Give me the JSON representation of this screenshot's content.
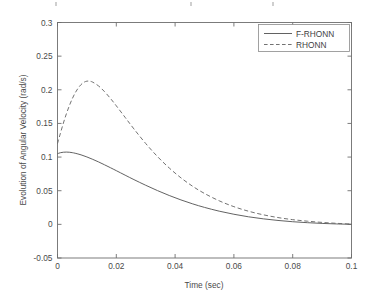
{
  "figure": {
    "background_color": "#ffffff",
    "line_color": "#5a5a5a",
    "axis_color": "#6e6e6e"
  },
  "chart_data": {
    "type": "line",
    "title": "",
    "xlabel": "Time (sec)",
    "ylabel": "Evolution of Angular Velocity (rad/s)",
    "xlim": [
      0,
      0.1
    ],
    "ylim": [
      -0.05,
      0.3
    ],
    "xticks": [
      0,
      0.02,
      0.04,
      0.06,
      0.08,
      0.1
    ],
    "xticklabels": [
      "0",
      "0.02",
      "0.04",
      "0.06",
      "0.08",
      "0.1"
    ],
    "yticks": [
      -0.05,
      0,
      0.05,
      0.1,
      0.15,
      0.2,
      0.25,
      0.3
    ],
    "yticklabels": [
      "-0.05",
      "0",
      "0.05",
      "0.1",
      "0.15",
      "0.2",
      "0.25",
      "0.3"
    ],
    "grid": false,
    "legend_position": "upper right",
    "series": [
      {
        "name": "F-RHONN",
        "style": "solid",
        "color": "#5a5a5a",
        "x": [
          0,
          0.001,
          0.002,
          0.003,
          0.004,
          0.005,
          0.006,
          0.008,
          0.01,
          0.012,
          0.014,
          0.016,
          0.018,
          0.02,
          0.023,
          0.026,
          0.03,
          0.034,
          0.038,
          0.042,
          0.046,
          0.05,
          0.055,
          0.06,
          0.065,
          0.07,
          0.075,
          0.08,
          0.085,
          0.09,
          0.095,
          0.1
        ],
        "y": [
          0.105,
          0.1065,
          0.1072,
          0.1074,
          0.1072,
          0.1066,
          0.1057,
          0.1033,
          0.1002,
          0.0966,
          0.0927,
          0.0885,
          0.0842,
          0.0798,
          0.0731,
          0.0665,
          0.0581,
          0.0502,
          0.0429,
          0.0363,
          0.0304,
          0.0252,
          0.0196,
          0.015,
          0.0112,
          0.0082,
          0.0058,
          0.0039,
          0.0025,
          0.0014,
          0.0006,
          0.0001
        ]
      },
      {
        "name": "RHONN",
        "style": "dashed",
        "color": "#6a6a6a",
        "x": [
          0,
          0.001,
          0.002,
          0.003,
          0.004,
          0.005,
          0.006,
          0.007,
          0.008,
          0.009,
          0.01,
          0.011,
          0.012,
          0.014,
          0.016,
          0.018,
          0.02,
          0.023,
          0.026,
          0.03,
          0.034,
          0.038,
          0.042,
          0.046,
          0.05,
          0.055,
          0.06,
          0.065,
          0.07,
          0.075,
          0.08,
          0.085,
          0.09,
          0.095,
          0.1
        ],
        "y": [
          0.12,
          0.1355,
          0.1505,
          0.164,
          0.176,
          0.1865,
          0.1953,
          0.2023,
          0.2077,
          0.2112,
          0.2128,
          0.2127,
          0.2113,
          0.2056,
          0.1972,
          0.1872,
          0.1762,
          0.159,
          0.1418,
          0.1202,
          0.1008,
          0.0838,
          0.0691,
          0.0565,
          0.0459,
          0.035,
          0.0263,
          0.0195,
          0.0142,
          0.0101,
          0.007,
          0.0047,
          0.0029,
          0.0015,
          0.0004
        ]
      }
    ]
  },
  "legend": {
    "entries": [
      {
        "label": "F-RHONN",
        "style": "solid"
      },
      {
        "label": "RHONN",
        "style": "dashed"
      }
    ]
  }
}
